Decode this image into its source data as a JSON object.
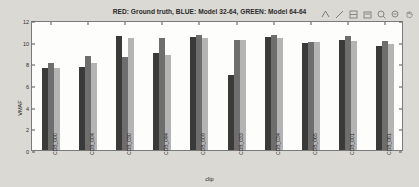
{
  "window": {
    "background": "#dbd9d4",
    "plot_background": "#fdfdfc"
  },
  "toolbar": {
    "buttons": [
      {
        "name": "data-cursor-icon",
        "label": "Data Cursor"
      },
      {
        "name": "insert-line-icon",
        "label": "Insert Line"
      },
      {
        "name": "insert-colorbar-icon",
        "label": "Insert Colorbar"
      },
      {
        "name": "insert-legend-icon",
        "label": "Insert Legend"
      },
      {
        "name": "zoom-in-icon",
        "label": "Zoom In"
      },
      {
        "name": "zoom-out-icon",
        "label": "Zoom Out"
      },
      {
        "name": "pan-icon",
        "label": "Pan"
      }
    ]
  },
  "chart_data": {
    "type": "bar",
    "title": "RED: Ground truth, BLUE: Model 32-64, GREEN: Model 64-64",
    "xlabel": "clip",
    "ylabel": "VMAF",
    "ylim": [
      0,
      12
    ],
    "yticks": [
      0,
      2,
      4,
      6,
      8,
      10,
      12
    ],
    "grid": false,
    "legend_position": "title",
    "categories": [
      "CDB_000",
      "CDB_004",
      "CDB_030",
      "CDB_044",
      "CDB_009",
      "CDB_033",
      "CDB_034",
      "CDB_065",
      "CDB_001",
      "CDB_061"
    ],
    "series": [
      {
        "name": "RED: Ground truth",
        "color": "#3a3a3a",
        "values": [
          7.6,
          7.7,
          10.5,
          9.0,
          10.4,
          6.9,
          10.4,
          9.9,
          10.2,
          9.6
        ]
      },
      {
        "name": "BLUE: Model 32-64",
        "color": "#6e6e6e",
        "values": [
          8.0,
          8.7,
          8.6,
          10.3,
          10.6,
          10.2,
          10.6,
          10.0,
          10.5,
          10.1
        ]
      },
      {
        "name": "GREEN: Model 64-64",
        "color": "#b4b4b4",
        "values": [
          7.6,
          8.0,
          10.3,
          8.8,
          10.3,
          10.2,
          10.3,
          10.0,
          10.1,
          9.8
        ]
      }
    ]
  }
}
